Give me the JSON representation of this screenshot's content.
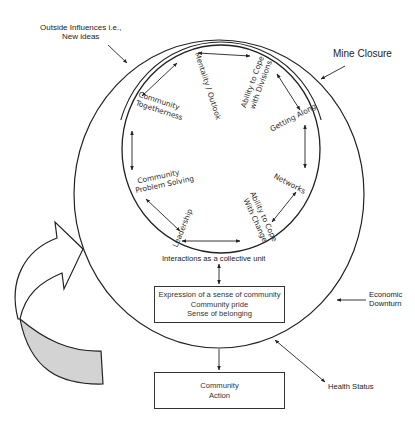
{
  "external_factors": {
    "outside_influences": [
      "Outside Influences i.e.,",
      "New ideas"
    ],
    "mine_closure": "Mine Closure",
    "economic_downturn": [
      "Economic",
      "Downturn"
    ],
    "health_status": "Health Status"
  },
  "inner_circle": {
    "nodes": [
      {
        "id": "mentality",
        "lines": [
          "Mentality / Outlook"
        ]
      },
      {
        "id": "cope-divisions",
        "lines": [
          "Ability to Cope",
          "with Divisions"
        ]
      },
      {
        "id": "getting-along",
        "lines": [
          "Getting Along"
        ]
      },
      {
        "id": "networks",
        "lines": [
          "Networks"
        ]
      },
      {
        "id": "cope-change",
        "lines": [
          "Ability to Cope",
          "With Change"
        ]
      },
      {
        "id": "leadership",
        "lines": [
          "Leadership"
        ]
      },
      {
        "id": "problem-solving",
        "lines": [
          "Community",
          "Problem Solving"
        ]
      },
      {
        "id": "togetherness",
        "lines": [
          "Community",
          "Togetherness"
        ]
      }
    ]
  },
  "interactions_label": "Interactions as a collective unit",
  "sense_of_community_box": {
    "lines": [
      "Expression of a sense of community",
      "Community pride",
      "Sense of belonging"
    ]
  },
  "community_action_box": {
    "lines": [
      "Community",
      "Action"
    ]
  },
  "colors": {
    "line": "#222222",
    "feedback_arrow_fill": "#d3d3d3",
    "background": "#ffffff"
  }
}
